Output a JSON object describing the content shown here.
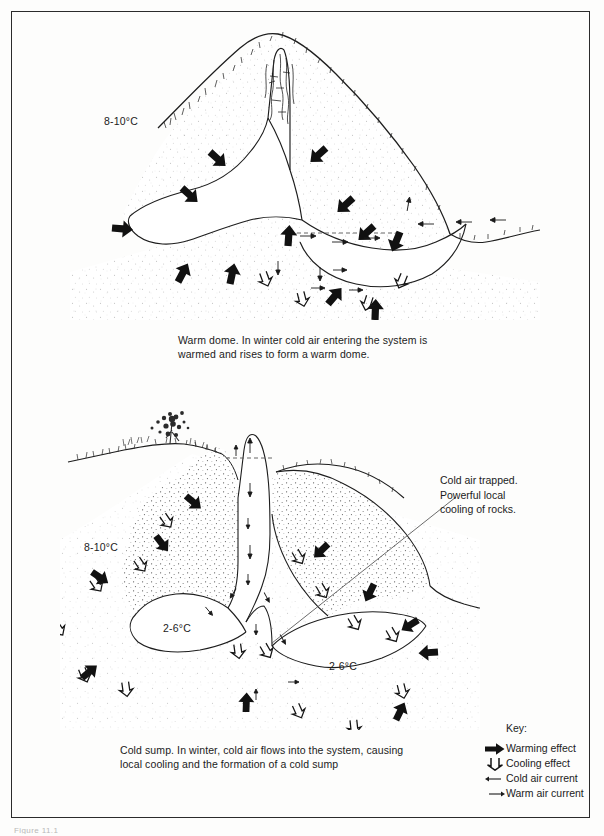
{
  "page": {
    "background": "#fdfdfc",
    "border_color": "#2b2b2b",
    "ink_color": "#1b1b1b"
  },
  "figure_top": {
    "name": "warm-dome-cave-cross-section",
    "caption": "Warm dome.  In winter cold air entering the system is warmed and rises to form a warm dome.",
    "labels": [
      {
        "id": "outer-temperature",
        "text": "8-10°C"
      }
    ]
  },
  "figure_bottom": {
    "name": "cold-sump-cave-cross-section",
    "caption": "Cold sump.  In winter, cold air flows into the system, causing local cooling and the formation of a cold sump",
    "labels": [
      {
        "id": "outer-temperature",
        "text": "8-10°C"
      },
      {
        "id": "chamber-left-temperature",
        "text": "2-6°C"
      },
      {
        "id": "chamber-right-temperature",
        "text": "2-6°C"
      }
    ],
    "annotation": {
      "line1": "Cold air trapped.",
      "line2": "Powerful local",
      "line3": "cooling of rocks."
    }
  },
  "key": {
    "title": "Key:",
    "items": [
      {
        "glyph": "thick-right-arrow-icon",
        "label": "Warming effect"
      },
      {
        "glyph": "hollow-down-arrow-icon",
        "label": "Cooling effect"
      },
      {
        "glyph": "thin-left-arrow-icon",
        "label": "Cold air current"
      },
      {
        "glyph": "thin-right-arrow-icon",
        "label": "Warm air current"
      }
    ]
  },
  "footer": {
    "cropped_text": "Figure 11.1"
  }
}
